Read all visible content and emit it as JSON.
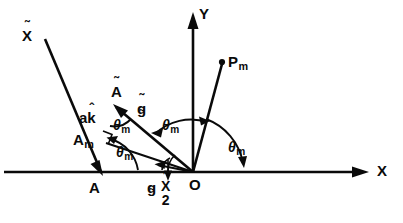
{
  "figure": {
    "type": "geometric-vector-diagram",
    "background_color": "#ffffff",
    "ink_color": "#0a0a0a"
  },
  "axes": {
    "x_label": "X",
    "y_label": "Y",
    "origin_label": "O"
  },
  "points": [
    {
      "id": "A",
      "label": "A"
    },
    {
      "id": "A_tilde",
      "label": "A",
      "accent": "tilde"
    },
    {
      "id": "A_m",
      "label": "A",
      "subscript": "m"
    },
    {
      "id": "P_m",
      "label": "P",
      "subscript": "m"
    },
    {
      "id": "O",
      "label": "O"
    }
  ],
  "vectors": [
    {
      "id": "x_tilde",
      "label": "X",
      "accent": "tilde"
    },
    {
      "id": "a_k_hat",
      "label_a": "a",
      "label_k": "k",
      "accent": "hat"
    },
    {
      "id": "g_tilde",
      "label": "g",
      "accent": "tilde"
    },
    {
      "id": "g_under",
      "label": "g",
      "accent": "under-tilde"
    }
  ],
  "angles": [
    {
      "id": "theta-m-at-A",
      "symbol": "θ",
      "subscript": "m"
    },
    {
      "id": "theta-m-at-A-tilde",
      "symbol": "θ",
      "subscript": "m"
    },
    {
      "id": "theta-m-from-Y",
      "symbol": "θ",
      "subscript": "m"
    },
    {
      "id": "theta-m-from-X",
      "symbol": "θ",
      "subscript": "m"
    }
  ],
  "fraction_label": {
    "numerator": "X",
    "numerator_accent": "tilde",
    "denominator": "2"
  },
  "glyphs": {
    "tilde": "˜",
    "hat": "ˆ",
    "under_tilde": "˜",
    "theta": "θ"
  }
}
